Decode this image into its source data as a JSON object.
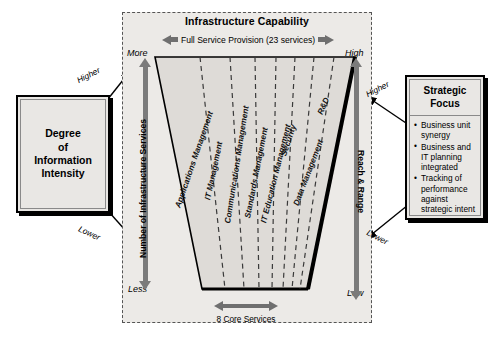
{
  "diagram": {
    "title": "Infrastructure Capability",
    "region": {
      "provision_label": "Full Service Provision (23 services)",
      "scale_top_left": "More",
      "scale_bottom_left": "Less",
      "scale_top_right": "High",
      "scale_bottom_right": "Low",
      "axis_left_caption": "Number of Infrastructure Services",
      "axis_right_caption": "Reach & Range",
      "core_services_label": "8 Core Services"
    },
    "services": [
      "Applications Management",
      "IT Management",
      "Communications Management",
      "Standards Management",
      "IT Education Management",
      "Security",
      "Data Management",
      "R&D"
    ],
    "left_box": {
      "line1": "Degree",
      "line2": "of",
      "line3": "Information",
      "line4": "Intensity"
    },
    "right_box": {
      "title_line1": "Strategic",
      "title_line2": "Focus",
      "bullets": [
        "Business unit synergy",
        "Business and IT planning integrated",
        "Tracking of performance against strategic intent"
      ]
    },
    "connectors": {
      "left_upper": "Higher",
      "left_lower": "Lower",
      "right_upper": "Higher",
      "right_lower": "Lower"
    },
    "colors": {
      "region_fill": "#eceae7",
      "arrow_gray": "#7b7b7b",
      "v_fill": "#dedbd7",
      "outline": "#000000",
      "dash_border": "#555555"
    }
  }
}
